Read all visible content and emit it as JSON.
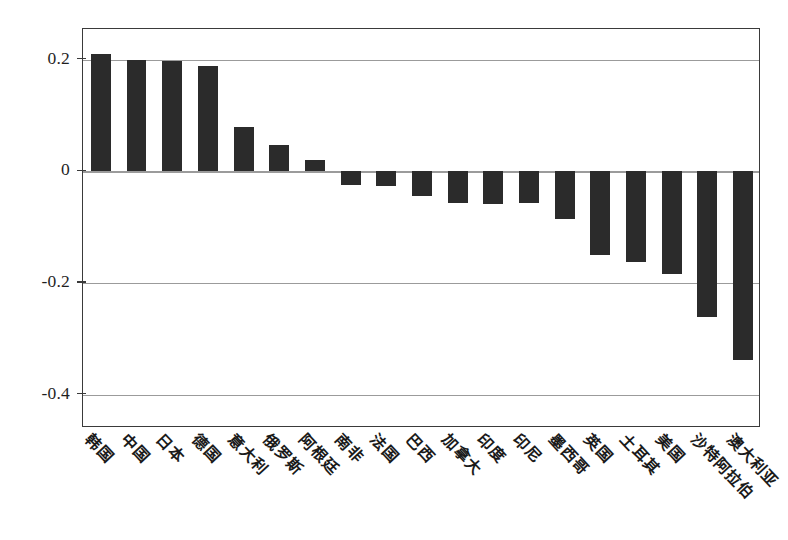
{
  "chart_data": {
    "type": "bar",
    "title": "",
    "subtitle": "",
    "xlabel": "",
    "ylabel": "",
    "categories": [
      "韩国",
      "中国",
      "日本",
      "德国",
      "意大利",
      "俄罗斯",
      "阿根廷",
      "南非",
      "法国",
      "巴西",
      "加拿大",
      "印度",
      "印尼",
      "墨西哥",
      "英国",
      "土耳其",
      "美国",
      "沙特阿拉伯",
      "澳大利亚"
    ],
    "values": [
      0.211,
      0.199,
      0.197,
      0.188,
      0.08,
      0.047,
      0.02,
      -0.024,
      -0.026,
      -0.045,
      -0.056,
      -0.058,
      -0.057,
      -0.085,
      -0.15,
      -0.162,
      -0.184,
      -0.261,
      -0.338
    ],
    "series": [
      {
        "name": "",
        "values": [
          0.211,
          0.199,
          0.197,
          0.188,
          0.08,
          0.047,
          0.02,
          -0.024,
          -0.026,
          -0.045,
          -0.056,
          -0.058,
          -0.057,
          -0.085,
          -0.15,
          -0.162,
          -0.184,
          -0.261,
          -0.338
        ]
      }
    ],
    "ylim": [
      -0.46,
      0.255
    ],
    "ytick_values": [
      0.2,
      0,
      -0.2,
      -0.4
    ],
    "ytick_labels": [
      "0.2",
      "0",
      "-0.2",
      "-0.4"
    ],
    "grid": true,
    "legend": null,
    "bar_color": "#2b2b2b",
    "gridline_color": "#9b9b9b",
    "frame_color": "#3a3a3a",
    "background_color": "#ffffff"
  }
}
